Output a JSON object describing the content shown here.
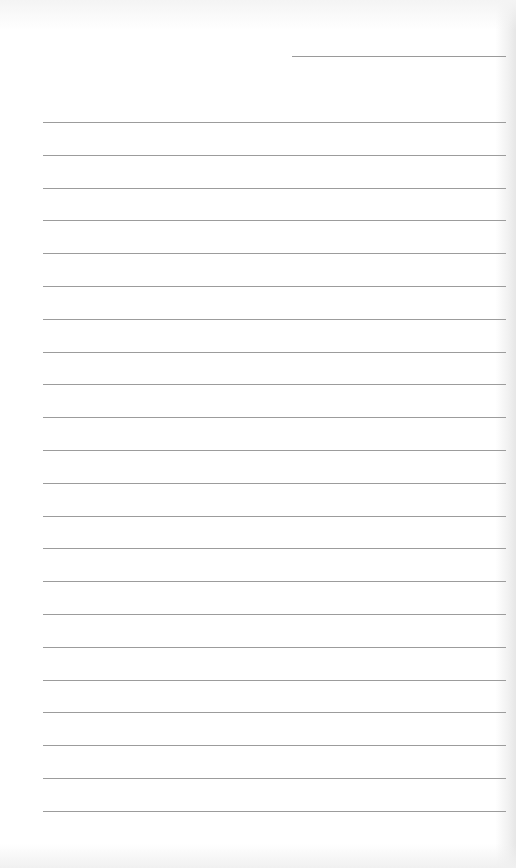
{
  "page": {
    "type": "lined-paper",
    "background_color": "#ffffff",
    "line_color": "#9c9c9c",
    "date_line": {
      "x": 292,
      "y": 56,
      "width": 214
    },
    "rules": {
      "count": 22,
      "start_y": 122,
      "spacing": 32.8,
      "x": 43,
      "width": 463
    }
  }
}
